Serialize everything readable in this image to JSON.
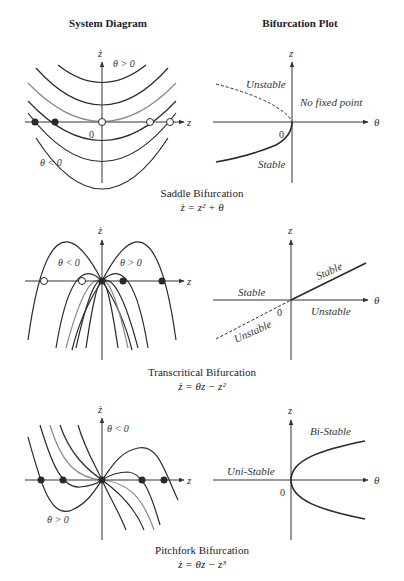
{
  "columns": {
    "left_title": "System Diagram",
    "right_title": "Bifurcation Plot"
  },
  "panels": [
    {
      "name": "Saddle Bifurcation",
      "equation": "ż = z² + θ",
      "system": {
        "x_axis_label": "z",
        "y_axis_label": "ż",
        "origin_label": "0",
        "region_labels": [
          "θ > 0",
          "θ < 0"
        ],
        "fixed_points": [
          {
            "z": -77,
            "type": "stable"
          },
          {
            "z": -55,
            "type": "stable"
          },
          {
            "z": 0,
            "type": "semi-stable"
          },
          {
            "z": 48,
            "type": "unstable"
          },
          {
            "z": 68,
            "type": "unstable"
          }
        ]
      },
      "bifurcation": {
        "x_axis_label": "θ",
        "y_axis_label": "z",
        "origin_label": "0",
        "branch_labels": {
          "upper": "Unstable",
          "lower": "Stable",
          "region": "No fixed point"
        }
      }
    },
    {
      "name": "Transcritical Bifurcation",
      "equation": "ż = θz − z²",
      "system": {
        "x_axis_label": "z",
        "y_axis_label": "ż",
        "region_labels": [
          "θ < 0",
          "θ > 0"
        ],
        "fixed_points": [
          {
            "z": -58,
            "type": "unstable"
          },
          {
            "z": -20,
            "type": "unstable"
          },
          {
            "z": 0,
            "type": "stable"
          },
          {
            "z": 21,
            "type": "stable"
          },
          {
            "z": 60,
            "type": "stable"
          }
        ]
      },
      "bifurcation": {
        "x_axis_label": "θ",
        "y_axis_label": "z",
        "origin_label": "0",
        "branch_labels": {
          "left_upper": "Stable",
          "left_lower": "Unstable",
          "right_upper": "Stable",
          "right_lower": "Unstable"
        }
      }
    },
    {
      "name": "Pitchfork Bifurcation",
      "equation": "ż = θz − z³",
      "system": {
        "x_axis_label": "z",
        "y_axis_label": "ż",
        "region_labels": [
          "θ < 0",
          "θ > 0"
        ],
        "fixed_points": [
          {
            "z": -61,
            "type": "stable"
          },
          {
            "z": -39,
            "type": "stable"
          },
          {
            "z": 0,
            "type": "stable"
          },
          {
            "z": 40,
            "type": "stable"
          },
          {
            "z": 63,
            "type": "stable"
          }
        ]
      },
      "bifurcation": {
        "x_axis_label": "θ",
        "y_axis_label": "z",
        "origin_label": "0",
        "branch_labels": {
          "left": "Uni-Stable",
          "right": "Bi-Stable"
        }
      }
    }
  ],
  "colors": {
    "curve": "#2a2a2a",
    "curve_highlight": "#8a8a8a",
    "axis": "#333333",
    "background": "#ffffff"
  }
}
